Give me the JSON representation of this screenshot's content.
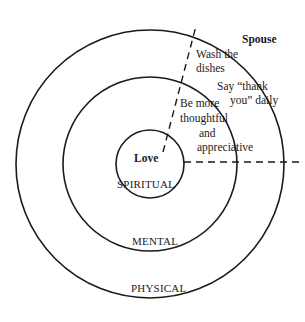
{
  "diagram": {
    "rings": [
      {
        "label": "Love",
        "sublabel": "SPIRITUAL"
      },
      {
        "label": "MENTAL"
      },
      {
        "label": "PHYSICAL"
      }
    ],
    "sector_title": "Spouse",
    "mental_text": [
      "Be more",
      "thoughtful",
      "and",
      "appreciative"
    ],
    "physical_text_1": [
      "Wash the",
      "dishes"
    ],
    "physical_text_2": [
      "Say “thank",
      "you” daily"
    ],
    "colors": {
      "line": "#1a1a1a",
      "background": "#ffffff"
    }
  }
}
